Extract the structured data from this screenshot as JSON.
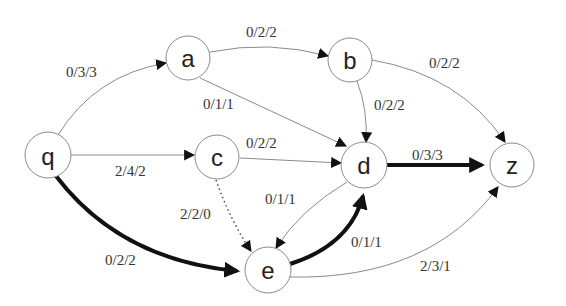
{
  "diagram": {
    "type": "flow-network",
    "nodes": [
      {
        "id": "q",
        "label": "q",
        "x": 48,
        "y": 155
      },
      {
        "id": "a",
        "label": "a",
        "x": 188,
        "y": 58
      },
      {
        "id": "b",
        "label": "b",
        "x": 350,
        "y": 60
      },
      {
        "id": "c",
        "label": "c",
        "x": 217,
        "y": 157
      },
      {
        "id": "d",
        "label": "d",
        "x": 364,
        "y": 165
      },
      {
        "id": "z",
        "label": "z",
        "x": 512,
        "y": 165
      },
      {
        "id": "e",
        "label": "e",
        "x": 268,
        "y": 270
      }
    ],
    "edges": [
      {
        "id": "q-a",
        "from": "q",
        "to": "a",
        "label": "0/3/3",
        "style": "thin"
      },
      {
        "id": "a-b",
        "from": "a",
        "to": "b",
        "label": "0/2/2",
        "style": "thin"
      },
      {
        "id": "a-d",
        "from": "a",
        "to": "d",
        "label": "0/1/1",
        "style": "thin"
      },
      {
        "id": "b-d",
        "from": "b",
        "to": "d",
        "label": "0/2/2",
        "style": "thin"
      },
      {
        "id": "b-z",
        "from": "b",
        "to": "z",
        "label": "0/2/2",
        "style": "thin"
      },
      {
        "id": "q-c",
        "from": "q",
        "to": "c",
        "label": "2/4/2",
        "style": "thin"
      },
      {
        "id": "c-d",
        "from": "c",
        "to": "d",
        "label": "0/2/2",
        "style": "thin"
      },
      {
        "id": "d-z",
        "from": "d",
        "to": "z",
        "label": "0/3/3",
        "style": "thick"
      },
      {
        "id": "c-e",
        "from": "c",
        "to": "e",
        "label": "2/2/0",
        "style": "dotted"
      },
      {
        "id": "d-e",
        "from": "d",
        "to": "e",
        "label": "0/1/1",
        "style": "thin"
      },
      {
        "id": "e-d",
        "from": "e",
        "to": "d",
        "label": "0/1/1",
        "style": "thick"
      },
      {
        "id": "q-e",
        "from": "q",
        "to": "e",
        "label": "0/2/2",
        "style": "thick"
      },
      {
        "id": "e-z",
        "from": "e",
        "to": "z",
        "label": "2/3/1",
        "style": "thin"
      }
    ]
  },
  "labels": {
    "q": "q",
    "a": "a",
    "b": "b",
    "c": "c",
    "d": "d",
    "z": "z",
    "e": "e",
    "q_a": "0/3/3",
    "a_b": "0/2/2",
    "a_d": "0/1/1",
    "b_d": "0/2/2",
    "b_z": "0/2/2",
    "q_c": "2/4/2",
    "c_d": "0/2/2",
    "d_z": "0/3/3",
    "c_e": "2/2/0",
    "d_e": "0/1/1",
    "e_d": "0/1/1",
    "q_e": "0/2/2",
    "e_z": "2/3/1"
  },
  "colors": {
    "background": "#ffffff",
    "node_stroke": "#8a8a8a",
    "thin_edge": "#8a8a8a",
    "thick_edge": "#111111",
    "text": "#222222"
  }
}
